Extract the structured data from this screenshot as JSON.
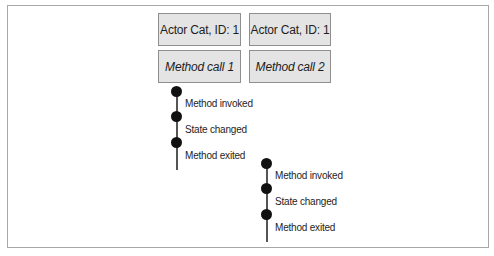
{
  "diagram": {
    "columns": [
      {
        "actor_label": "Actor Cat, ID: 1",
        "method_label": "Method call 1"
      },
      {
        "actor_label": "Actor Cat, ID: 1",
        "method_label": "Method call 2"
      }
    ],
    "timelines": [
      {
        "events": [
          "Method invoked",
          "State changed",
          "Method exited"
        ]
      },
      {
        "events": [
          "Method invoked",
          "State changed",
          "Method exited"
        ]
      }
    ]
  },
  "colors": {
    "box_fill": "#e4e4e4",
    "box_border": "#8f8f8f",
    "dot": "#111111",
    "line": "#555555"
  }
}
